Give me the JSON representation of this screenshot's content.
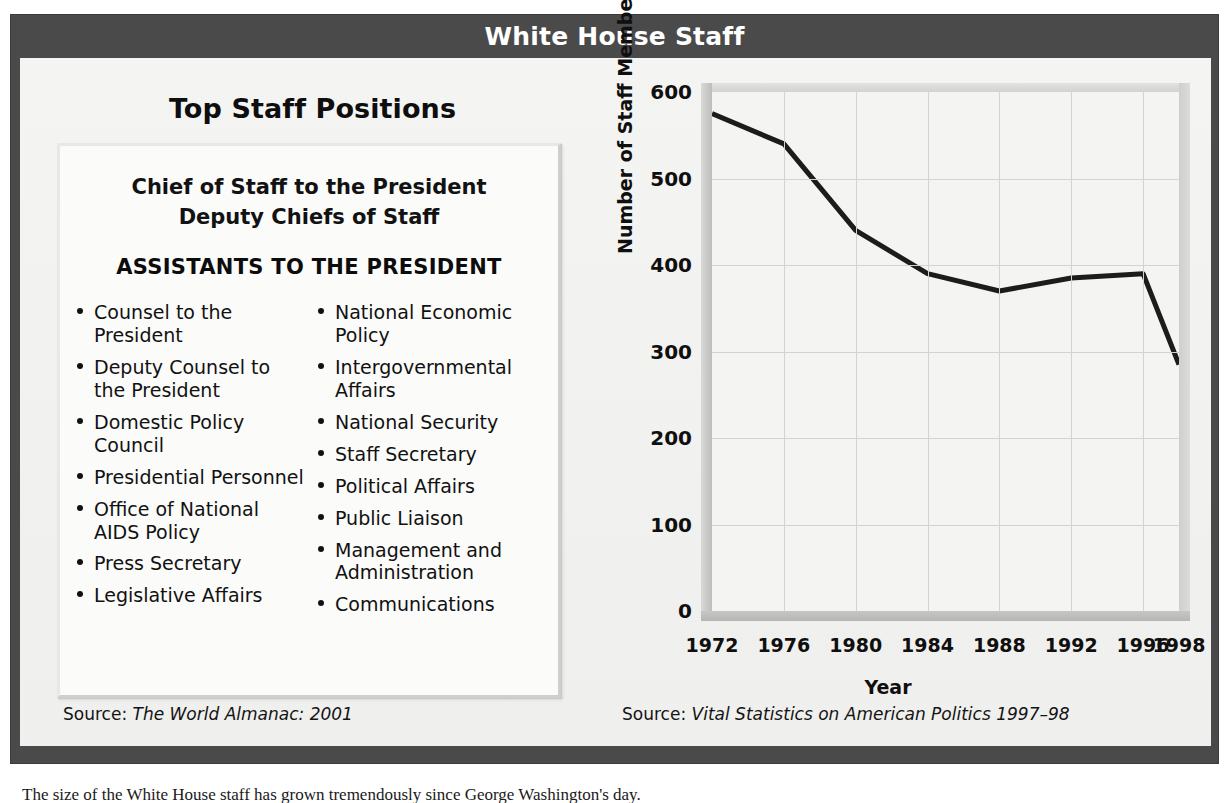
{
  "figure": {
    "title": "White House Staff",
    "frame_color": "#4a4a4a",
    "body_color": "#f2f2f0"
  },
  "left_panel": {
    "heading": "Top Staff Positions",
    "top_lines": [
      "Chief of Staff to the President",
      "Deputy Chiefs of Staff"
    ],
    "subheading": "ASSISTANTS TO THE PRESIDENT",
    "column_left": [
      "Counsel to the President",
      "Deputy Counsel to the President",
      "Domestic Policy Council",
      "Presidential Personnel",
      "Office of National AIDS Policy",
      "Press Secretary",
      "Legislative Affairs"
    ],
    "column_right": [
      "National Economic Policy",
      "Intergovernmental Affairs",
      "National Security",
      "Staff Secretary",
      "Political Affairs",
      "Public Liaison",
      "Management and Administration",
      "Communications"
    ],
    "source_label": "Source: ",
    "source_title": "The World Almanac: 2001"
  },
  "right_panel": {
    "heading": "Decline in Staff",
    "source_label": "Source: ",
    "source_title": "Vital Statistics on American Politics 1997–98"
  },
  "chart_data": {
    "type": "line",
    "title": "Decline in Staff",
    "xlabel": "Year",
    "ylabel": "Number of Staff Members",
    "x": [
      1972,
      1976,
      1980,
      1984,
      1988,
      1992,
      1996,
      1998
    ],
    "values": [
      575,
      540,
      440,
      390,
      370,
      385,
      390,
      285
    ],
    "categories": [
      "1972",
      "1976",
      "1980",
      "1984",
      "1988",
      "1992",
      "1996",
      "1998"
    ],
    "xtick_labels": [
      "1972",
      "1976",
      "1980",
      "1984",
      "1988",
      "1992",
      "1996",
      "1998"
    ],
    "ytick_labels": [
      "0",
      "100",
      "200",
      "300",
      "400",
      "500",
      "600"
    ],
    "yticks": [
      0,
      100,
      200,
      300,
      400,
      500,
      600
    ],
    "ylim": [
      0,
      600
    ],
    "xlim": [
      1972,
      1998
    ],
    "grid": true,
    "legend": "none",
    "line_color": "#1c1c1c",
    "line_width": 5
  },
  "caption": {
    "text": "The size of the White House staff has grown tremendously since George Washington's day."
  }
}
